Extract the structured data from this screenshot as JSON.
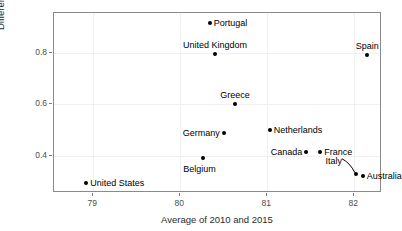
{
  "chart_data": {
    "type": "scatter",
    "title": "",
    "xlabel": "Average of 2010 and 2015",
    "ylabel": "Difference between 2015 and 2010",
    "xlim": [
      78.55,
      82.32
    ],
    "ylim": [
      0.255,
      0.955
    ],
    "xticks": [
      79,
      80,
      81,
      82
    ],
    "xticklabels": [
      "79",
      "80",
      "81",
      "82"
    ],
    "yticks": [
      0.4,
      0.6,
      0.8
    ],
    "yticklabels": [
      "0.4",
      "0.6",
      "0.8"
    ],
    "grid": true,
    "legend": "none",
    "points": [
      {
        "label": "Portugal",
        "x": 80.34,
        "y": 0.915,
        "label_pos": "right"
      },
      {
        "label": "United Kingdom",
        "x": 80.4,
        "y": 0.795,
        "label_pos": "top"
      },
      {
        "label": "Spain",
        "x": 82.15,
        "y": 0.793,
        "label_pos": "top"
      },
      {
        "label": "Greece",
        "x": 80.63,
        "y": 0.6,
        "label_pos": "top"
      },
      {
        "label": "Germany",
        "x": 80.5,
        "y": 0.487,
        "label_pos": "left"
      },
      {
        "label": "Netherlands",
        "x": 81.03,
        "y": 0.5,
        "label_pos": "right"
      },
      {
        "label": "Belgium",
        "x": 80.26,
        "y": 0.393,
        "label_pos": "below"
      },
      {
        "label": "Canada",
        "x": 81.45,
        "y": 0.415,
        "label_pos": "left"
      },
      {
        "label": "France",
        "x": 81.61,
        "y": 0.415,
        "label_pos": "right"
      },
      {
        "label": "Italy",
        "x": 82.02,
        "y": 0.33,
        "label_pos": "leader"
      },
      {
        "label": "Australia",
        "x": 82.1,
        "y": 0.32,
        "label_pos": "right"
      },
      {
        "label": "United States",
        "x": 78.92,
        "y": 0.293,
        "label_pos": "right"
      }
    ]
  }
}
